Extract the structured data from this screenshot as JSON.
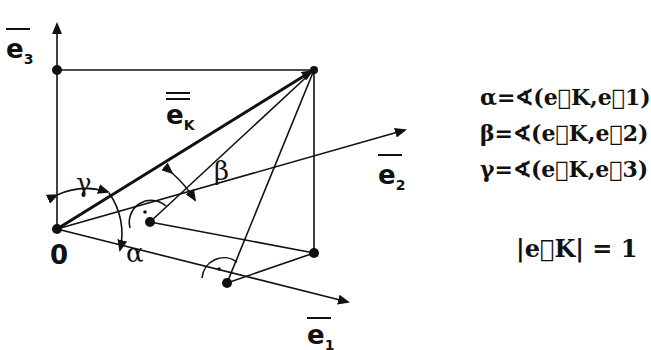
{
  "diagram": {
    "labels": {
      "e1": "e",
      "e1_sub": "1",
      "e2": "e",
      "e2_sub": "2",
      "e3": "e",
      "e3_sub": "3",
      "ek": "e",
      "ek_sub": "K",
      "origin": "0",
      "alpha": "α",
      "beta": "β",
      "gamma": "γ"
    },
    "formulas": [
      {
        "angle": "α",
        "text": "α=∢(e⃗K,e⃗1)"
      },
      {
        "angle": "β",
        "text": "β=∢(e⃗K,e⃗2)"
      },
      {
        "angle": "γ",
        "text": "γ=∢(e⃗K,e⃗3)"
      }
    ],
    "norm": "|e⃗K| = 1",
    "colors": {
      "ink": "#111111",
      "background": "#ffffff"
    }
  }
}
